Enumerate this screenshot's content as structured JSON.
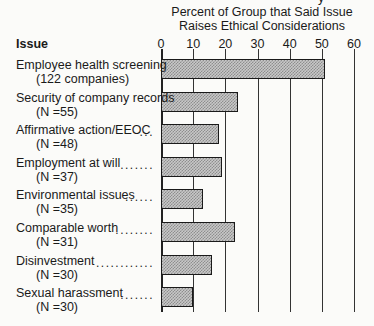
{
  "chart_data": {
    "type": "bar",
    "orientation": "horizontal",
    "title": "Percent of Group that Said Issue Raises Ethical Considerations",
    "title_lines": [
      "Percent of Group that Said Issue",
      "Raises Ethical Considerations"
    ],
    "category_header": "Issue",
    "xlabel": "Percent of Group that Said Issue Raises Ethical Considerations",
    "ylabel": "Issue",
    "xlim": [
      0,
      60
    ],
    "ticks": [
      "0",
      "10",
      "20",
      "30",
      "40",
      "50",
      "60"
    ],
    "grid": true,
    "categories": [
      {
        "label": "Employee health screening",
        "sub": "(122 companies)",
        "leader": ""
      },
      {
        "label": "Security of company records",
        "sub": "(N=55)",
        "leader": ""
      },
      {
        "label": "Affirmative action/EEOC",
        "sub": "(N=48)",
        "leader": "..."
      },
      {
        "label": "Employment at will",
        "sub": "(N=37)",
        "leader": "......."
      },
      {
        "label": "Environmental issues",
        "sub": "(N=35)",
        "leader": "......"
      },
      {
        "label": "Comparable worth",
        "sub": "(N=31)",
        "leader": "........"
      },
      {
        "label": "Disinvestment",
        "sub": "(N=30)",
        "leader": "............"
      },
      {
        "label": "Sexual harassment",
        "sub": "(N=30)",
        "leader": "......."
      }
    ],
    "values": [
      51,
      24,
      18,
      19,
      13,
      23,
      16,
      10
    ],
    "top_fragment": "y"
  }
}
